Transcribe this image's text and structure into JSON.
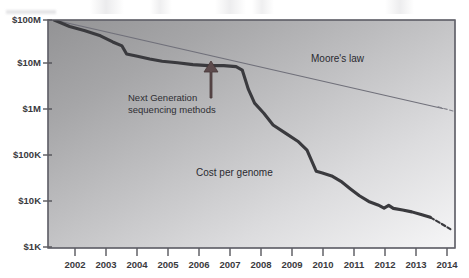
{
  "figure": {
    "title": "",
    "background_color": "#ffffff",
    "plot_gradient_from": "#9a9a9c",
    "plot_gradient_to": "#f2f2f2",
    "border_color": "#6a6a6e"
  },
  "axes": {
    "y_label": "",
    "x_label": "",
    "y_ticks": [
      "$100M",
      "$10M",
      "$1M",
      "$100K",
      "$10K",
      "$1K"
    ],
    "x_ticks": [
      "2002",
      "2003",
      "2004",
      "2005",
      "2006",
      "2007",
      "2008",
      "2009",
      "2010",
      "2011",
      "2012",
      "2013",
      "2014"
    ]
  },
  "annotations": {
    "moores_law": "Moore's law",
    "cost_per_genome": "Cost per genome",
    "ngs_line1": "Next Generation",
    "ngs_line2": "sequencing methods",
    "arrow_name": "up-arrow-icon",
    "arrow_color": "#5c4a4c"
  },
  "chart_data": {
    "type": "line",
    "title": "",
    "xlabel": "",
    "ylabel": "",
    "yscale": "log",
    "ylim": [
      1000,
      100000000
    ],
    "xlim": [
      2001.2,
      2014.4
    ],
    "grid": false,
    "legend": "inline-annotations",
    "series": [
      {
        "name": "Cost per genome",
        "color": "#3a3a3e",
        "linewidth": 3,
        "style": "solid",
        "x": [
          2001.4,
          2001.9,
          2002.4,
          2002.9,
          2003.3,
          2003.6,
          2003.75,
          2004.1,
          2004.5,
          2004.9,
          2005.4,
          2005.9,
          2006.4,
          2006.9,
          2007.3,
          2007.5,
          2007.7,
          2007.9,
          2008.2,
          2008.5,
          2008.9,
          2009.3,
          2009.6,
          2009.9,
          2010.1,
          2010.4,
          2010.7,
          2011.0,
          2011.3,
          2011.6,
          2011.9,
          2012.1,
          2012.25,
          2012.4,
          2012.7,
          2013.0,
          2013.3,
          2013.6
        ],
        "y": [
          100000000,
          72000000,
          58000000,
          45000000,
          33000000,
          27000000,
          18000000,
          16000000,
          14000000,
          12500000,
          11500000,
          10500000,
          10000000,
          10000000,
          9500000,
          8000000,
          3000000,
          1500000,
          900000,
          500000,
          330000,
          220000,
          140000,
          48000,
          44000,
          38000,
          29000,
          20000,
          14000,
          10500,
          8800,
          7500,
          8600,
          7400,
          6800,
          6200,
          5400,
          4700
        ]
      },
      {
        "name": "Cost per genome (projected)",
        "color": "#3a3a3e",
        "linewidth": 2,
        "style": "dashed",
        "x": [
          2013.6,
          2013.9,
          2014.25
        ],
        "y": [
          4700,
          3600,
          2600
        ]
      },
      {
        "name": "Moore's law",
        "color": "#70707a",
        "linewidth": 1,
        "style": "solid",
        "x": [
          2001.4,
          2014.0
        ],
        "y": [
          100000000,
          1150000
        ]
      },
      {
        "name": "Moore's law (projected)",
        "color": "#80808a",
        "linewidth": 1,
        "style": "dashed",
        "x": [
          2013.85,
          2014.35
        ],
        "y": [
          1250000,
          1000000
        ]
      }
    ]
  }
}
